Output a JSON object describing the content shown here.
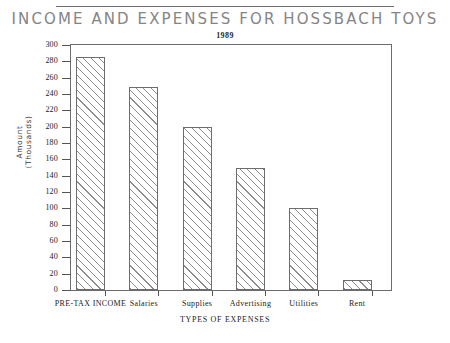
{
  "chart_data": {
    "type": "bar",
    "title": "INCOME AND EXPENSES FOR HOSSBACH TOYS",
    "subtitle": "1989",
    "xlabel": "TYPES OF EXPENSES",
    "ylabel": "Amount (Thousands)",
    "ylabel_line1": "Amount",
    "ylabel_line2": "(Thousands)",
    "categories": [
      "PRE-TAX INCOME",
      "Salaries",
      "Supplies",
      "Advertising",
      "Utilities",
      "Rent"
    ],
    "values": [
      285,
      249,
      200,
      149,
      100,
      12
    ],
    "ylim": [
      0,
      300
    ],
    "ytick_step": 20,
    "ytick_labels": [
      "0",
      "20",
      "40",
      "60",
      "80",
      "100",
      "120",
      "140",
      "160",
      "180",
      "200",
      "220",
      "240",
      "260",
      "280",
      "300"
    ],
    "grid": false,
    "legend": "none",
    "bar_fill": "hatch-diagonal",
    "colors": {
      "title": "#858585",
      "axis": "#6b6b6b",
      "text": "#222222",
      "hatch": "#787878",
      "bar_border": "#6d6d6d",
      "background": "#ffffff"
    }
  }
}
